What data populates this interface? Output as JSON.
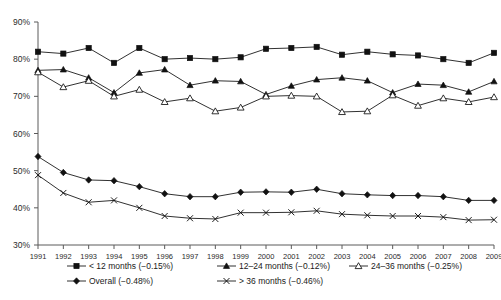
{
  "chart_data": {
    "type": "line",
    "title": "",
    "subtitle": "",
    "xlabel": "",
    "ylabel": "",
    "x": [
      1991,
      1992,
      1993,
      1994,
      1995,
      1996,
      1997,
      1998,
      1999,
      2000,
      2001,
      2002,
      2003,
      2004,
      2005,
      2006,
      2007,
      2008,
      2009
    ],
    "xtick_labels": [
      "1991",
      "1992",
      "1993",
      "1994",
      "1995",
      "1996",
      "1997",
      "1998",
      "1999",
      "2000",
      "2001",
      "2002",
      "2003",
      "2004",
      "2005",
      "2006",
      "2007",
      "2008",
      "2009"
    ],
    "ytick_labels": [
      "30%",
      "40%",
      "50%",
      "60%",
      "70%",
      "80%",
      "90%"
    ],
    "ytick_values": [
      30,
      40,
      50,
      60,
      70,
      80,
      90
    ],
    "ylim": [
      30,
      90
    ],
    "xlim": [
      1991,
      2009
    ],
    "grid": false,
    "legend_position": "bottom",
    "series": [
      {
        "name": "< 12 months (−0.15%)",
        "marker": "filled-square",
        "values": [
          82.0,
          81.5,
          83.0,
          79.0,
          83.0,
          80.0,
          80.3,
          80.0,
          80.5,
          82.8,
          83.0,
          83.3,
          81.2,
          82.0,
          81.3,
          81.0,
          80.0,
          79.0,
          81.7
        ]
      },
      {
        "name": "12–24 months (−0.12%)",
        "marker": "filled-triangle",
        "values": [
          77.0,
          77.2,
          75.0,
          71.0,
          76.3,
          77.2,
          73.0,
          74.2,
          74.0,
          70.5,
          72.8,
          74.5,
          75.0,
          74.2,
          71.0,
          73.3,
          73.0,
          71.2,
          74.0
        ]
      },
      {
        "name": "24–36 months (−0.25%)",
        "marker": "open-triangle",
        "values": [
          76.5,
          72.5,
          74.2,
          70.0,
          71.8,
          68.5,
          69.5,
          66.0,
          67.0,
          70.0,
          70.2,
          70.0,
          65.8,
          66.0,
          70.3,
          67.5,
          69.5,
          68.5,
          69.8
        ]
      },
      {
        "name": "Overall (−0.48%)",
        "marker": "filled-diamond",
        "values": [
          53.8,
          49.5,
          47.5,
          47.3,
          45.7,
          43.8,
          43.0,
          43.0,
          44.2,
          44.3,
          44.2,
          45.0,
          43.8,
          43.5,
          43.3,
          43.3,
          43.0,
          42.0,
          42.0
        ]
      },
      {
        "name": "> 36 months (−0.46%)",
        "marker": "cross",
        "values": [
          48.8,
          44.0,
          41.5,
          42.0,
          40.0,
          37.8,
          37.2,
          37.0,
          38.7,
          38.7,
          38.8,
          39.2,
          38.3,
          38.0,
          37.8,
          37.8,
          37.5,
          36.7,
          36.8
        ]
      }
    ]
  },
  "legend": {
    "entries": [
      {
        "label": "< 12 months (−0.15%)",
        "marker": "filled-square"
      },
      {
        "label": "12–24 months (−0.12%)",
        "marker": "filled-triangle"
      },
      {
        "label": "24–36 months (−0.25%)",
        "marker": "open-triangle"
      },
      {
        "label": "Overall (−0.48%)",
        "marker": "filled-diamond"
      },
      {
        "label": "> 36 months (−0.46%)",
        "marker": "cross"
      }
    ]
  },
  "colors": {
    "line": "#111111",
    "axis": "#5a5a5a",
    "text": "#1a1a1a",
    "background": "#ffffff"
  }
}
